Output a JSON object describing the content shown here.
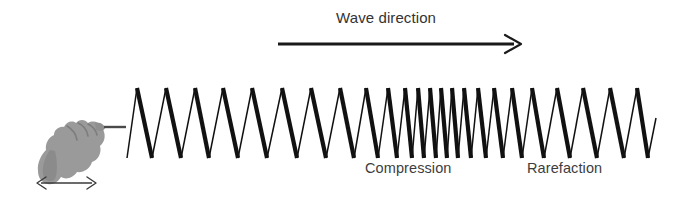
{
  "figure": {
    "background_color": "#ffffff",
    "width": 696,
    "height": 202
  },
  "labels": {
    "wave_direction": "Wave direction",
    "compression": "Compression",
    "rarefaction": "Rarefaction"
  },
  "colors": {
    "text": "#3a3a3a",
    "spring_stroke": "#111111",
    "arrow": "#1a1a1a",
    "hand_fill": "#9a9a9a",
    "hand_shade": "#8a8a8a"
  },
  "chart_data": {
    "type": "line",
    "xlabel": "",
    "ylabel": "",
    "annotations": [
      {
        "text": "Wave direction",
        "x": 336,
        "y": 9
      },
      {
        "text": "Compression",
        "x": 365,
        "y": 160
      },
      {
        "text": "Rarefaction",
        "x": 527,
        "y": 160
      }
    ],
    "wave_direction_arrow": {
      "x1": 278,
      "y1": 44,
      "x2": 521,
      "y2": 44,
      "direction": "right"
    },
    "oscillation_arrow": {
      "x1": 37,
      "y1": 183,
      "x2": 96,
      "y2": 183,
      "direction": "both"
    },
    "spring": {
      "lead_line": {
        "x1": 104,
        "y1": 127,
        "x2": 125,
        "y2": 127
      },
      "crest_y": 88,
      "trough_y": 158,
      "start_x": 125,
      "end_x": 656,
      "peak_x": [
        137,
        166,
        195,
        223,
        252,
        282,
        311,
        340,
        366,
        388,
        405,
        418,
        430,
        441,
        452,
        464,
        478,
        494,
        512,
        532,
        557,
        583,
        610,
        637
      ],
      "valley_x": [
        127,
        152,
        181,
        209,
        238,
        267,
        297,
        326,
        354,
        378,
        397,
        412,
        424,
        436,
        447,
        458,
        471,
        486,
        503,
        522,
        544,
        570,
        597,
        624,
        648
      ],
      "end_point": {
        "x": 656,
        "y": 118
      },
      "description": "Zigzag spring coil: evenly spaced at left, tightly packed in compression zone, widely spaced in rarefaction zone"
    }
  }
}
